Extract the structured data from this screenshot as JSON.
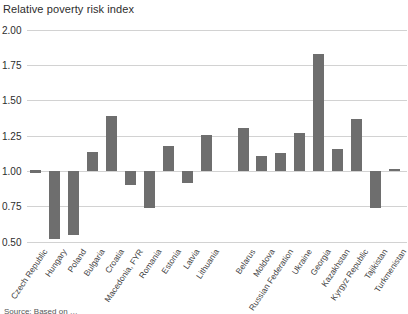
{
  "title": "Relative poverty risk index",
  "source_note": "Source: Based on …",
  "colors": {
    "bar": "#6e6e6e",
    "grid": "#d2d2d2",
    "text": "#2d2d2d"
  },
  "chart_data": {
    "type": "bar",
    "title": "Relative poverty risk index",
    "xlabel": "",
    "ylabel": "Relative poverty risk index",
    "ylim": [
      0.5,
      2.0
    ],
    "baseline": 1.0,
    "grid": "horizontal",
    "legend": "none",
    "yticks": [
      "2.00",
      "1.75",
      "1.50",
      "1.25",
      "1.00",
      "0.75",
      "0.50"
    ],
    "ytick_values": [
      2.0,
      1.75,
      1.5,
      1.25,
      1.0,
      0.75,
      0.5
    ],
    "categories": [
      "Czech Republic",
      "Hungary",
      "Poland",
      "Bulgaria",
      "Croatia",
      "Macedonia, FYR",
      "Romania",
      "Estonia",
      "Latvia",
      "Lithuania",
      "Belarus",
      "Moldova",
      "Russian Federation",
      "Ukraine",
      "Georgia",
      "Kazakhstan",
      "Kyrgyz Republic",
      "Tajikistan",
      "Turkmenistan"
    ],
    "values": [
      1.0,
      0.52,
      0.55,
      1.14,
      1.39,
      0.9,
      0.74,
      1.18,
      0.92,
      1.26,
      1.31,
      1.11,
      1.13,
      1.27,
      1.83,
      1.16,
      1.37,
      0.74,
      1.02
    ],
    "group_gap_after_index": 9
  }
}
